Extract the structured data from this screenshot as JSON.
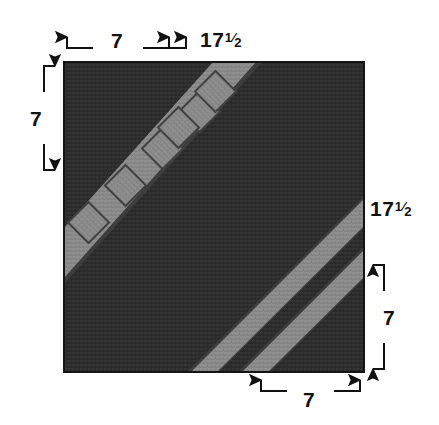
{
  "diagram": {
    "type": "technical-sewing-diagram",
    "canvas": {
      "width": 439,
      "height": 425,
      "background": "#ffffff"
    },
    "block": {
      "name": "fabric-block",
      "x": 64,
      "y": 62,
      "width": 300,
      "height": 310,
      "fill": "#2e2e2e",
      "border": "#1a1a1a",
      "texture": "woven-fabric-speckle"
    },
    "stripe_color": "#8a8a8a",
    "stripe_shadow": "#454545",
    "stripes": [
      {
        "name": "upper-left-solid-stripe",
        "style": "solid",
        "width_units": 17.5,
        "angle_deg": 45,
        "region": "upper-left"
      },
      {
        "name": "lower-right-solid-stripe-inner",
        "style": "solid",
        "width_units": 7,
        "angle_deg": 45,
        "region": "lower-right"
      },
      {
        "name": "lower-right-solid-stripe-outer",
        "style": "solid",
        "width_units": 7,
        "angle_deg": 45,
        "region": "lower-right"
      }
    ],
    "dashed_line": {
      "name": "upper-left-dashed-stripe",
      "style": "dashed",
      "angle_deg": 45,
      "segment_count": 6,
      "segment_shape": "diamond",
      "region": "upper-left"
    }
  },
  "dimensions": {
    "top_left": {
      "value": "7",
      "fraction": null,
      "position": "top",
      "arrow_direction": "down"
    },
    "top_right": {
      "value": "17",
      "fraction": "1/2",
      "position": "top",
      "arrow_direction": "down"
    },
    "left": {
      "value": "7",
      "fraction": null,
      "position": "left",
      "arrow_direction": "right"
    },
    "right_upper": {
      "value": "17",
      "fraction": "1/2",
      "position": "right",
      "arrow_direction": "left"
    },
    "right_lower": {
      "value": "7",
      "fraction": null,
      "position": "right",
      "arrow_direction": "left"
    },
    "bottom": {
      "value": "7",
      "fraction": null,
      "position": "bottom",
      "arrow_direction": "up"
    }
  },
  "fraction_parts": {
    "numerator": "1",
    "slash": "⁄",
    "denominator": "2"
  }
}
